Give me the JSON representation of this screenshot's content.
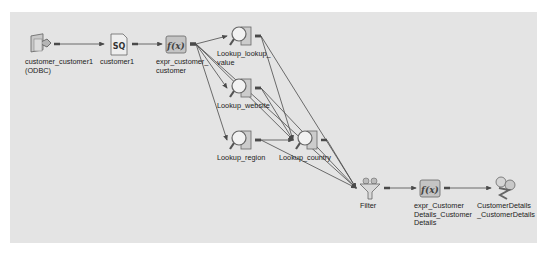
{
  "diagram": {
    "type": "etl-mapping",
    "background": "#e4e4e4",
    "edge_color": "#4a4a4a",
    "nodes": [
      {
        "id": "src",
        "label": "customer_customer1\n(ODBC)",
        "icon": "source-definition-icon",
        "x": 40,
        "y": 44
      },
      {
        "id": "sq",
        "label": "customer1",
        "icon": "source-qualifier-icon",
        "x": 118,
        "y": 44
      },
      {
        "id": "expr1",
        "label": "expr_customer_\ncustomer",
        "icon": "expression-transformation-icon",
        "x": 176,
        "y": 44
      },
      {
        "id": "lk_value",
        "label": "Lookup_lookup_\nvalue",
        "icon": "lookup-transformation-icon",
        "x": 241,
        "y": 36
      },
      {
        "id": "lk_web",
        "label": "Lookup_website",
        "icon": "lookup-transformation-icon",
        "x": 241,
        "y": 88
      },
      {
        "id": "lk_region",
        "label": "Lookup_region",
        "icon": "lookup-transformation-icon",
        "x": 241,
        "y": 140
      },
      {
        "id": "lk_country",
        "label": "Lookup_country",
        "icon": "lookup-transformation-icon",
        "x": 307,
        "y": 140
      },
      {
        "id": "filter",
        "label": "Filter",
        "icon": "filter-transformation-icon",
        "x": 370,
        "y": 188
      },
      {
        "id": "expr2",
        "label": "expr_Customer\nDetails_Customer\nDetails",
        "icon": "expression-transformation-icon",
        "x": 430,
        "y": 188
      },
      {
        "id": "tgt",
        "label": "CustomerDetails\n_CustomerDetails",
        "icon": "target-definition-icon",
        "x": 505,
        "y": 188
      }
    ],
    "edges": [
      [
        "src",
        "sq"
      ],
      [
        "sq",
        "expr1"
      ],
      [
        "expr1",
        "lk_value"
      ],
      [
        "expr1",
        "lk_web"
      ],
      [
        "expr1",
        "lk_region"
      ],
      [
        "expr1",
        "lk_country"
      ],
      [
        "expr1",
        "filter"
      ],
      [
        "lk_value",
        "lk_country"
      ],
      [
        "lk_value",
        "filter"
      ],
      [
        "lk_web",
        "lk_country"
      ],
      [
        "lk_web",
        "filter"
      ],
      [
        "lk_region",
        "lk_country"
      ],
      [
        "lk_region",
        "filter"
      ],
      [
        "lk_country",
        "filter"
      ],
      [
        "filter",
        "expr2"
      ],
      [
        "expr2",
        "tgt"
      ]
    ]
  }
}
